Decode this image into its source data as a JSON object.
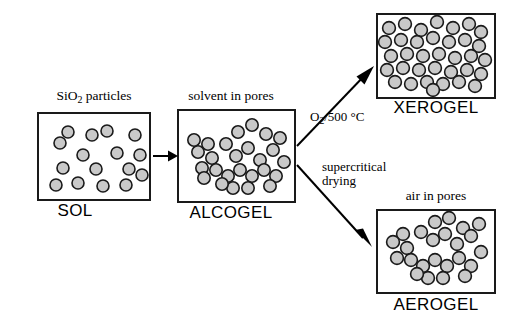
{
  "figure": {
    "type": "process-flow-diagram",
    "background_color": "#ffffff",
    "particle_fill": "#c9c9c9",
    "particle_stroke": "#1a1a1a",
    "box_stroke": "#1a1a1a"
  },
  "panels": {
    "sol": {
      "top_caption": "SiO₂ particles",
      "top_caption_main": "SiO",
      "top_caption_sub": "2",
      "top_caption_rest": " particles",
      "bottom_label": "SOL",
      "description": "dispersed separated silica particles"
    },
    "alcogel": {
      "top_caption": "solvent in pores",
      "bottom_label": "ALCOGEL",
      "description": "connected particle network with solvent filled pores"
    },
    "xerogel": {
      "top_caption": "",
      "bottom_label": "XEROGEL",
      "description": "densely packed collapsed particle network"
    },
    "aerogel": {
      "top_caption": "air in pores",
      "bottom_label": "AEROGEL",
      "description": "open branched particle network with air filled pores"
    }
  },
  "arrows": {
    "gelation": {
      "label": "",
      "from": "sol",
      "to": "alcogel"
    },
    "upper_branch": {
      "label": "O₂/500 °C",
      "label_main": "O",
      "label_sub": "2",
      "label_rest": "/500 °C",
      "from": "alcogel",
      "to": "xerogel"
    },
    "lower_branch": {
      "label_line1": "supercritical",
      "label_line2": "drying",
      "from": "alcogel",
      "to": "aerogel"
    }
  },
  "geometry": {
    "sol_box": {
      "x": 38,
      "y": 113,
      "w": 112,
      "h": 87
    },
    "alcogel_box": {
      "x": 178,
      "y": 110,
      "w": 117,
      "h": 92
    },
    "xerogel_box": {
      "x": 377,
      "y": 14,
      "w": 118,
      "h": 84
    },
    "aerogel_box": {
      "x": 377,
      "y": 210,
      "w": 118,
      "h": 83
    }
  },
  "particle_layout": {
    "sol": [
      [
        22,
        30
      ],
      [
        54,
        22
      ],
      [
        79,
        40
      ],
      [
        97,
        22
      ],
      [
        69,
        18
      ],
      [
        45,
        42
      ],
      [
        25,
        55
      ],
      [
        58,
        56
      ],
      [
        91,
        56
      ],
      [
        18,
        72
      ],
      [
        40,
        70
      ],
      [
        65,
        73
      ],
      [
        88,
        72
      ],
      [
        30,
        19
      ],
      [
        102,
        42
      ],
      [
        104,
        62
      ]
    ],
    "alcogel": [
      [
        60,
        22
      ],
      [
        74,
        15
      ],
      [
        88,
        24
      ],
      [
        48,
        34
      ],
      [
        58,
        46
      ],
      [
        70,
        38
      ],
      [
        82,
        50
      ],
      [
        95,
        40
      ],
      [
        102,
        28
      ],
      [
        30,
        34
      ],
      [
        20,
        42
      ],
      [
        34,
        48
      ],
      [
        24,
        58
      ],
      [
        38,
        60
      ],
      [
        50,
        66
      ],
      [
        62,
        60
      ],
      [
        74,
        66
      ],
      [
        86,
        60
      ],
      [
        98,
        66
      ],
      [
        55,
        78
      ],
      [
        44,
        74
      ],
      [
        70,
        78
      ],
      [
        106,
        52
      ],
      [
        92,
        76
      ],
      [
        16,
        30
      ],
      [
        26,
        68
      ]
    ],
    "xerogel": [
      [
        12,
        14
      ],
      [
        28,
        10
      ],
      [
        44,
        16
      ],
      [
        60,
        8
      ],
      [
        76,
        14
      ],
      [
        92,
        10
      ],
      [
        104,
        18
      ],
      [
        8,
        28
      ],
      [
        24,
        26
      ],
      [
        40,
        28
      ],
      [
        56,
        24
      ],
      [
        72,
        28
      ],
      [
        88,
        26
      ],
      [
        102,
        32
      ],
      [
        14,
        42
      ],
      [
        30,
        40
      ],
      [
        46,
        42
      ],
      [
        62,
        40
      ],
      [
        78,
        44
      ],
      [
        94,
        42
      ],
      [
        108,
        46
      ],
      [
        10,
        56
      ],
      [
        26,
        54
      ],
      [
        42,
        56
      ],
      [
        58,
        54
      ],
      [
        74,
        58
      ],
      [
        90,
        56
      ],
      [
        104,
        60
      ],
      [
        18,
        68
      ],
      [
        34,
        70
      ],
      [
        50,
        68
      ],
      [
        66,
        70
      ],
      [
        82,
        68
      ],
      [
        98,
        72
      ],
      [
        56,
        76
      ]
    ],
    "aerogel": [
      [
        58,
        12
      ],
      [
        72,
        8
      ],
      [
        86,
        18
      ],
      [
        44,
        22
      ],
      [
        56,
        30
      ],
      [
        68,
        24
      ],
      [
        80,
        34
      ],
      [
        94,
        26
      ],
      [
        102,
        14
      ],
      [
        26,
        24
      ],
      [
        16,
        32
      ],
      [
        30,
        38
      ],
      [
        20,
        48
      ],
      [
        34,
        50
      ],
      [
        46,
        56
      ],
      [
        58,
        50
      ],
      [
        70,
        56
      ],
      [
        82,
        48
      ],
      [
        94,
        56
      ],
      [
        51,
        68
      ],
      [
        40,
        64
      ],
      [
        66,
        68
      ],
      [
        104,
        42
      ],
      [
        88,
        66
      ]
    ]
  }
}
